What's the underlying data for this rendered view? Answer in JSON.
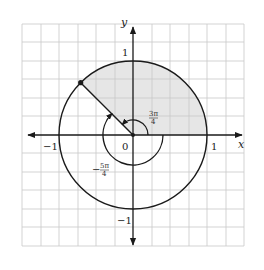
{
  "diagram": {
    "axes": {
      "x_label": "x",
      "y_label": "y",
      "tick_labels": {
        "x_neg": "−1",
        "x_pos": "1",
        "y_pos": "1",
        "y_neg": "−1",
        "origin": "0"
      }
    },
    "angles": {
      "positive": {
        "numerator": "3π",
        "denominator": "4",
        "direction": "counterclockwise"
      },
      "negative": {
        "sign": "−",
        "numerator": "5π",
        "denominator": "4",
        "direction": "clockwise"
      }
    },
    "point": {
      "angle_deg": 135,
      "on": "unit circle"
    },
    "shaded_region": {
      "from_deg": 0,
      "to_deg": 135,
      "color": "#e6e6e6"
    },
    "colors": {
      "grid": "#c8c8c8",
      "stroke": "#1a1a1a",
      "shade": "#e6e6e6"
    },
    "grid": {
      "cells_per_unit": 4
    }
  }
}
